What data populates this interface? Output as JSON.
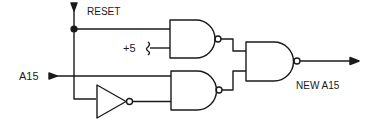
{
  "diagram": {
    "type": "logic-circuit",
    "labels": {
      "reset": "RESET",
      "plus5": "+5",
      "input": "A15",
      "output": "NEW A15"
    },
    "components": [
      {
        "id": "inverter",
        "type": "NOT",
        "input": "RESET-branch"
      },
      {
        "id": "nand-top",
        "type": "NAND",
        "inputs": [
          "RESET",
          "+5"
        ]
      },
      {
        "id": "nand-bottom",
        "type": "NAND",
        "inputs": [
          "A15",
          "NOT RESET"
        ]
      },
      {
        "id": "nand-out",
        "type": "NAND",
        "inputs": [
          "nand-top",
          "nand-bottom"
        ],
        "output": "NEW A15"
      }
    ],
    "colors": {
      "line": "#1a1a1a",
      "background": "#ffffff"
    }
  }
}
